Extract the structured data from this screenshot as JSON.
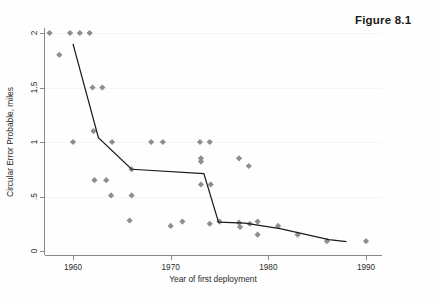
{
  "figure": {
    "caption": "Figure 8.1",
    "faint_header": ""
  },
  "chart_data": {
    "type": "scatter",
    "title": "",
    "xlabel": "Year of first deployment",
    "ylabel": "Circular Error Probable, miles",
    "xlim": [
      1957,
      1991
    ],
    "ylim": [
      0,
      2.05
    ],
    "xticks": [
      1960,
      1970,
      1980,
      1990
    ],
    "xticklabels": [
      "1960",
      "1970",
      "1980",
      "1990"
    ],
    "yticks": [
      0,
      0.5,
      1,
      1.5,
      2
    ],
    "yticklabels": [
      "0",
      ".5",
      "1",
      "1.5",
      "2"
    ],
    "grid": false,
    "legend": "none",
    "marker_color": "#8e8e8e",
    "line_color": "#1c1c1c",
    "points": [
      {
        "x": 1957.6,
        "y": 2.0
      },
      {
        "x": 1959.7,
        "y": 2.0
      },
      {
        "x": 1960.7,
        "y": 2.0
      },
      {
        "x": 1961.7,
        "y": 2.0
      },
      {
        "x": 1958.6,
        "y": 1.8
      },
      {
        "x": 1962.0,
        "y": 1.5
      },
      {
        "x": 1963.0,
        "y": 1.5
      },
      {
        "x": 1960.0,
        "y": 1.0
      },
      {
        "x": 1962.1,
        "y": 1.1
      },
      {
        "x": 1964.0,
        "y": 1.0
      },
      {
        "x": 1968.0,
        "y": 1.0
      },
      {
        "x": 1969.2,
        "y": 1.0
      },
      {
        "x": 1973.0,
        "y": 1.0
      },
      {
        "x": 1974.0,
        "y": 1.0
      },
      {
        "x": 1973.1,
        "y": 0.85
      },
      {
        "x": 1973.1,
        "y": 0.82
      },
      {
        "x": 1977.0,
        "y": 0.85
      },
      {
        "x": 1978.0,
        "y": 0.78
      },
      {
        "x": 1966.0,
        "y": 0.75
      },
      {
        "x": 1962.2,
        "y": 0.65
      },
      {
        "x": 1963.4,
        "y": 0.65
      },
      {
        "x": 1973.1,
        "y": 0.61
      },
      {
        "x": 1974.1,
        "y": 0.61
      },
      {
        "x": 1963.9,
        "y": 0.51
      },
      {
        "x": 1966.0,
        "y": 0.51
      },
      {
        "x": 1965.8,
        "y": 0.28
      },
      {
        "x": 1970.0,
        "y": 0.23
      },
      {
        "x": 1971.2,
        "y": 0.27
      },
      {
        "x": 1974.0,
        "y": 0.25
      },
      {
        "x": 1975.0,
        "y": 0.27
      },
      {
        "x": 1977.0,
        "y": 0.26
      },
      {
        "x": 1977.1,
        "y": 0.22
      },
      {
        "x": 1978.1,
        "y": 0.25
      },
      {
        "x": 1978.9,
        "y": 0.27
      },
      {
        "x": 1978.9,
        "y": 0.15
      },
      {
        "x": 1981.0,
        "y": 0.23
      },
      {
        "x": 1983.0,
        "y": 0.15
      },
      {
        "x": 1986.0,
        "y": 0.09
      },
      {
        "x": 1990.0,
        "y": 0.09
      }
    ],
    "fit_line": [
      {
        "x": 1960.0,
        "y": 1.9
      },
      {
        "x": 1962.6,
        "y": 1.04
      },
      {
        "x": 1966.0,
        "y": 0.75
      },
      {
        "x": 1973.4,
        "y": 0.71
      },
      {
        "x": 1974.9,
        "y": 0.265
      },
      {
        "x": 1977.6,
        "y": 0.255
      },
      {
        "x": 1981.2,
        "y": 0.205
      },
      {
        "x": 1986.2,
        "y": 0.105
      },
      {
        "x": 1988.0,
        "y": 0.085
      }
    ]
  }
}
